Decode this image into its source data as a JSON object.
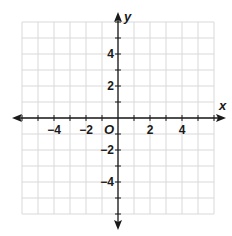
{
  "graph": {
    "title": "Coordinate plane",
    "axes": {
      "x_label": "x",
      "y_label": "y",
      "origin_label": "O",
      "range_min": -6,
      "range_max": 6,
      "grid_step": 1,
      "label_step": 2
    },
    "x_tick_labels": [
      {
        "value": -4,
        "text": "−4"
      },
      {
        "value": -2,
        "text": "−2"
      },
      {
        "value": 2,
        "text": "2"
      },
      {
        "value": 4,
        "text": "4"
      }
    ],
    "y_tick_labels": [
      {
        "value": 4,
        "text": "4"
      },
      {
        "value": 2,
        "text": "2"
      },
      {
        "value": -2,
        "text": "−2"
      },
      {
        "value": -4,
        "text": "−4"
      }
    ],
    "colors": {
      "grid": "#d9d9d9",
      "axis": "#1a1a1a",
      "background": "#ffffff"
    }
  }
}
